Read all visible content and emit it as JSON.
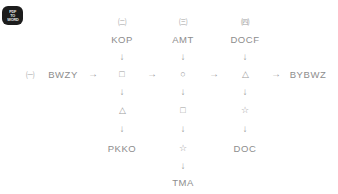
{
  "watermark": {
    "name": "watermark-badge",
    "line1": "PDF",
    "line2": "TO",
    "line3": "WORD"
  },
  "glyphs": {
    "arrow_right": "→",
    "arrow_down": "↓",
    "square": "□",
    "circle": "○",
    "triangle": "△",
    "star": "☆"
  },
  "colors": {
    "background": "#ffffff",
    "text": "#8d8d8d",
    "marker": "#a4a4a4",
    "shape": "#9b9b9b",
    "arrow": "#a0a0a0",
    "watermark_bg": "#1c1c1c"
  },
  "diagram": {
    "start": {
      "marker": "㈠",
      "label": "BWZY"
    },
    "end": {
      "label": "BYBWZ"
    },
    "columns": [
      {
        "marker": "㈡",
        "header": "KOP",
        "main_shape": "□",
        "below_shapes": [
          "△"
        ],
        "footer": "PKKO"
      },
      {
        "marker": "㈢",
        "header": "AMT",
        "main_shape": "○",
        "below_shapes": [
          "□",
          "☆"
        ],
        "footer": "TMA"
      },
      {
        "marker": "㈣",
        "header": "DOCF",
        "main_shape": "△",
        "below_shapes": [
          "☆"
        ],
        "footer": "DOC"
      }
    ],
    "horizontal_arrows": [
      "→",
      "→",
      "→",
      "→"
    ]
  }
}
